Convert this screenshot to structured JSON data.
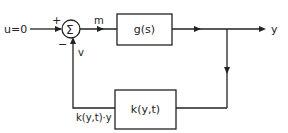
{
  "diagram": {
    "type": "block-diagram",
    "input_label": "u=0",
    "sum_junction": {
      "symbol": "Σ",
      "plus_sign": "+",
      "minus_sign": "−"
    },
    "signal_m": "m",
    "signal_v": "v",
    "forward_block": "g(s)",
    "output_label": "y",
    "feedback_block": "k(y,t)",
    "feedback_signal": "k(y,t)·y",
    "colors": {
      "line": "#222222",
      "background": "#ffffff"
    }
  }
}
